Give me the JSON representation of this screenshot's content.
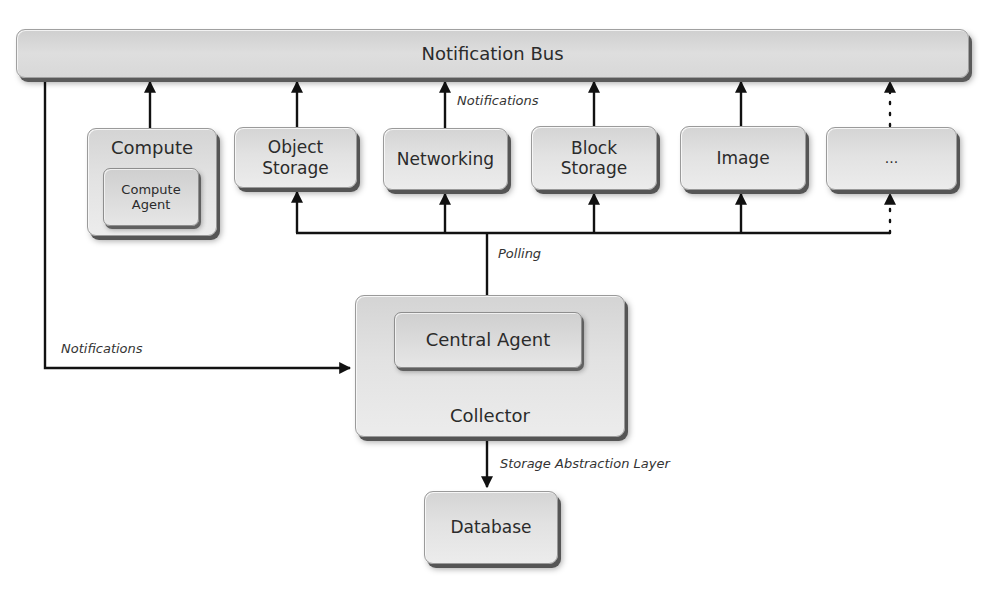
{
  "diagram": {
    "bus": {
      "label": "Notification Bus"
    },
    "services": [
      {
        "id": "compute",
        "label": "Compute",
        "inner_label": "Compute Agent"
      },
      {
        "id": "object-storage",
        "label": "Object Storage"
      },
      {
        "id": "networking",
        "label": "Networking"
      },
      {
        "id": "block-storage",
        "label": "Block Storage"
      },
      {
        "id": "image",
        "label": "Image"
      },
      {
        "id": "more",
        "label": "..."
      }
    ],
    "collector": {
      "label": "Collector",
      "inner_label": "Central Agent"
    },
    "database": {
      "label": "Database"
    },
    "edge_labels": {
      "services_to_bus": "Notifications",
      "bus_to_collector": "Notifications",
      "central_agent_polling": "Polling",
      "collector_to_database": "Storage Abstraction Layer"
    },
    "colors": {
      "box_fill": "#dedede",
      "box_border": "#9a9a9a",
      "shadow": "#555555",
      "line": "#111111",
      "text": "#2b2b2b"
    }
  }
}
